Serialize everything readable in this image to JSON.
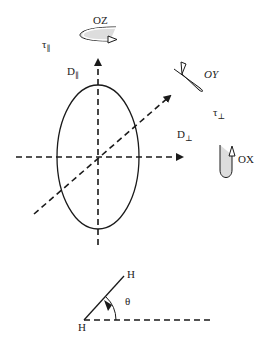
{
  "diagram": {
    "type": "rotational-diffusion-ellipsoid",
    "labels": {
      "oz": "OZ",
      "oy": "OY",
      "ox": "OX",
      "tau_parallel": "τ",
      "tau_parallel_sub": "∥",
      "tau_perp": "τ",
      "tau_perp_sub": "⊥",
      "d_parallel": "D",
      "d_parallel_sub": "∥",
      "d_perp": "D",
      "d_perp_sub": "⊥",
      "h_top": "H",
      "h_bottom": "H",
      "theta": "θ"
    },
    "colors": {
      "line": "#1a1a1a",
      "arrow_fill": "#ffffff",
      "arrow_shade": "#bbbbbb"
    }
  }
}
